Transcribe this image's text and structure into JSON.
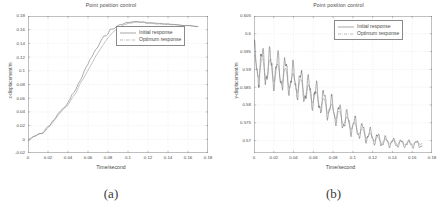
{
  "figure": {
    "caption_a": "(a)",
    "caption_b": "(b)"
  },
  "chart_data": [
    {
      "panel": "a",
      "type": "line",
      "title": "Point position control",
      "xlabel": "Time/second",
      "ylabel": "x-displacement/m",
      "xlim": [
        0,
        0.18
      ],
      "ylim": [
        -0.02,
        0.18
      ],
      "xticks": [
        "0",
        "0.02",
        "0.04",
        "0.06",
        "0.08",
        "0.1",
        "0.12",
        "0.14",
        "0.16",
        "0.18"
      ],
      "xtick_values": [
        0,
        0.02,
        0.04,
        0.06,
        0.08,
        0.1,
        0.12,
        0.14,
        0.16,
        0.18
      ],
      "yticks": [
        "-0.02",
        "0",
        "0.02",
        "0.04",
        "0.06",
        "0.08",
        "0.1",
        "0.12",
        "0.14",
        "0.16",
        "0.18"
      ],
      "ytick_values": [
        -0.02,
        0,
        0.02,
        0.04,
        0.06,
        0.08,
        0.1,
        0.12,
        0.14,
        0.16,
        0.18
      ],
      "grid": true,
      "legend_position": "upper-right-inside",
      "series": [
        {
          "name": "Initial response",
          "style": "solid",
          "color": "#6b6b6b",
          "x": [
            0,
            0.002,
            0.004,
            0.006,
            0.008,
            0.01,
            0.012,
            0.014,
            0.016,
            0.018,
            0.02,
            0.022,
            0.024,
            0.026,
            0.028,
            0.03,
            0.032,
            0.034,
            0.036,
            0.038,
            0.04,
            0.042,
            0.044,
            0.046,
            0.048,
            0.05,
            0.052,
            0.054,
            0.056,
            0.058,
            0.06,
            0.062,
            0.064,
            0.066,
            0.068,
            0.07,
            0.072,
            0.074,
            0.076,
            0.078,
            0.08,
            0.082,
            0.084,
            0.086,
            0.088,
            0.09,
            0.092,
            0.094,
            0.096,
            0.098,
            0.1,
            0.102,
            0.104,
            0.106,
            0.108,
            0.11,
            0.112,
            0.114,
            0.116,
            0.118,
            0.12,
            0.124,
            0.128,
            0.132,
            0.136,
            0.14,
            0.144,
            0.148,
            0.152,
            0.156,
            0.16,
            0.164,
            0.168,
            0.17
          ],
          "y": [
            -0.001,
            0.001,
            0.004,
            0.003,
            0.006,
            0.009,
            0.008,
            0.006,
            0.01,
            0.014,
            0.017,
            0.02,
            0.024,
            0.028,
            0.033,
            0.037,
            0.04,
            0.044,
            0.048,
            0.047,
            0.052,
            0.058,
            0.064,
            0.068,
            0.072,
            0.079,
            0.086,
            0.092,
            0.097,
            0.103,
            0.109,
            0.115,
            0.12,
            0.126,
            0.131,
            0.136,
            0.14,
            0.145,
            0.149,
            0.152,
            0.156,
            0.159,
            0.161,
            0.163,
            0.165,
            0.166,
            0.167,
            0.168,
            0.169,
            0.17,
            0.17,
            0.171,
            0.171,
            0.172,
            0.172,
            0.172,
            0.171,
            0.171,
            0.171,
            0.17,
            0.17,
            0.17,
            0.169,
            0.169,
            0.168,
            0.168,
            0.167,
            0.167,
            0.166,
            0.166,
            0.166,
            0.165,
            0.165,
            0.165
          ]
        },
        {
          "name": "Optimum response",
          "style": "dashdot",
          "color": "#8a8a8a",
          "x": [
            0,
            0.004,
            0.008,
            0.012,
            0.016,
            0.02,
            0.024,
            0.028,
            0.032,
            0.036,
            0.04,
            0.044,
            0.048,
            0.052,
            0.056,
            0.06,
            0.064,
            0.068,
            0.072,
            0.076,
            0.08,
            0.084,
            0.088,
            0.092,
            0.096,
            0.1,
            0.104,
            0.108,
            0.112,
            0.116,
            0.12,
            0.126,
            0.132,
            0.138,
            0.144,
            0.15,
            0.156,
            0.162,
            0.168,
            0.17
          ],
          "y": [
            -0.001,
            0.003,
            0.006,
            0.008,
            0.01,
            0.017,
            0.023,
            0.031,
            0.038,
            0.045,
            0.05,
            0.06,
            0.068,
            0.081,
            0.09,
            0.101,
            0.111,
            0.122,
            0.131,
            0.14,
            0.148,
            0.155,
            0.16,
            0.164,
            0.167,
            0.169,
            0.17,
            0.171,
            0.171,
            0.171,
            0.17,
            0.17,
            0.169,
            0.168,
            0.168,
            0.167,
            0.166,
            0.166,
            0.165,
            0.165
          ]
        }
      ]
    },
    {
      "panel": "b",
      "type": "line",
      "title": "Point position control",
      "xlabel": "Time/second",
      "ylabel": "y-displacement/m",
      "xlim": [
        0,
        0.18
      ],
      "ylim": [
        0.5665,
        0.605
      ],
      "xticks": [
        "0",
        "0.02",
        "0.04",
        "0.06",
        "0.08",
        "0.1",
        "0.12",
        "0.14",
        "0.16",
        "0.18"
      ],
      "xtick_values": [
        0,
        0.02,
        0.04,
        0.06,
        0.08,
        0.1,
        0.12,
        0.14,
        0.16,
        0.18
      ],
      "yticks": [
        "0.565",
        "0.57",
        "0.575",
        "0.58",
        "0.585",
        "0.59",
        "0.595",
        "0.6",
        "0.605"
      ],
      "ytick_values": [
        0.565,
        0.57,
        0.575,
        0.58,
        0.585,
        0.59,
        0.595,
        0.6,
        0.605
      ],
      "ytick_shown": [
        "0.57",
        "0.575",
        "0.58",
        "0.585",
        "0.59",
        "0.595",
        "0.6",
        "0.605"
      ],
      "grid": true,
      "legend_position": "upper-right-inside",
      "series": [
        {
          "name": "Initial response",
          "style": "solid",
          "color": "#6b6b6b",
          "description": "Damped oscillation decaying from ~0.600 to ~0.569",
          "envelope_center": [
            0.5915,
            0.5905,
            0.5885,
            0.5855,
            0.582,
            0.5785,
            0.575,
            0.572,
            0.57,
            0.5692,
            0.569,
            0.569
          ],
          "envelope_amp": [
            0.0048,
            0.0046,
            0.0042,
            0.0038,
            0.0034,
            0.003,
            0.0026,
            0.002,
            0.0014,
            0.001,
            0.0009,
            0.0009
          ],
          "envelope_x": [
            0.0,
            0.016,
            0.032,
            0.048,
            0.064,
            0.08,
            0.096,
            0.112,
            0.128,
            0.144,
            0.16,
            0.17
          ],
          "period": 0.0078
        },
        {
          "name": "Optimum response",
          "style": "dashdot",
          "color": "#8a8a8a",
          "description": "Smoother damped oscillation, smaller amplitude, settles to ~0.5693",
          "envelope_center": [
            0.591,
            0.5898,
            0.5878,
            0.585,
            0.5816,
            0.5782,
            0.5748,
            0.5718,
            0.57,
            0.5694,
            0.5693,
            0.5693
          ],
          "envelope_amp": [
            0.003,
            0.0028,
            0.0025,
            0.0022,
            0.0019,
            0.0016,
            0.0013,
            0.001,
            0.0007,
            0.0005,
            0.0004,
            0.0004
          ],
          "envelope_x": [
            0.0,
            0.016,
            0.032,
            0.048,
            0.064,
            0.08,
            0.096,
            0.112,
            0.128,
            0.144,
            0.16,
            0.17
          ],
          "period": 0.0078
        }
      ]
    }
  ],
  "colors": {
    "axis": "#8a8a8a",
    "grid": "#d9d9d9",
    "text": "#4a4a4a",
    "series_initial": "#6b6b6b",
    "series_optimum": "#8a8a8a",
    "background": "#ffffff"
  }
}
